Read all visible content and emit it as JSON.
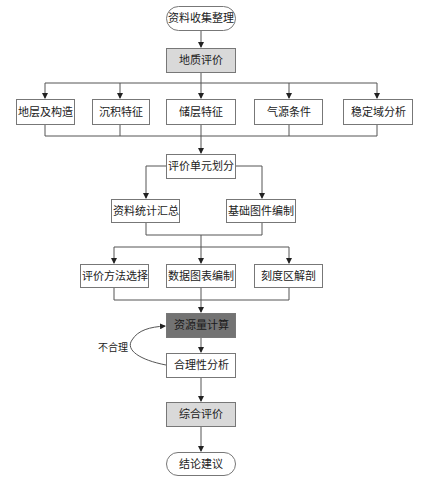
{
  "flowchart": {
    "start": "资料收集整理",
    "geology_eval": "地质评价",
    "factors": [
      "地层及构造",
      "沉积特征",
      "储层特征",
      "气源条件",
      "稳定域分析"
    ],
    "unit_division": "评价单元划分",
    "prep": [
      "资料统计汇总",
      "基础图件编制"
    ],
    "methods": [
      "评价方法选择",
      "数据图表编制",
      "刻度区解剖"
    ],
    "resource_calc": "资源量计算",
    "rationality": "合理性分析",
    "loop_label": "不合理",
    "overall_eval": "综合评价",
    "end": "结论建议"
  },
  "colors": {
    "line": "#555555",
    "node_border": "#777777",
    "gray_fill": "#d9d9d9",
    "dark_fill": "#737373"
  }
}
